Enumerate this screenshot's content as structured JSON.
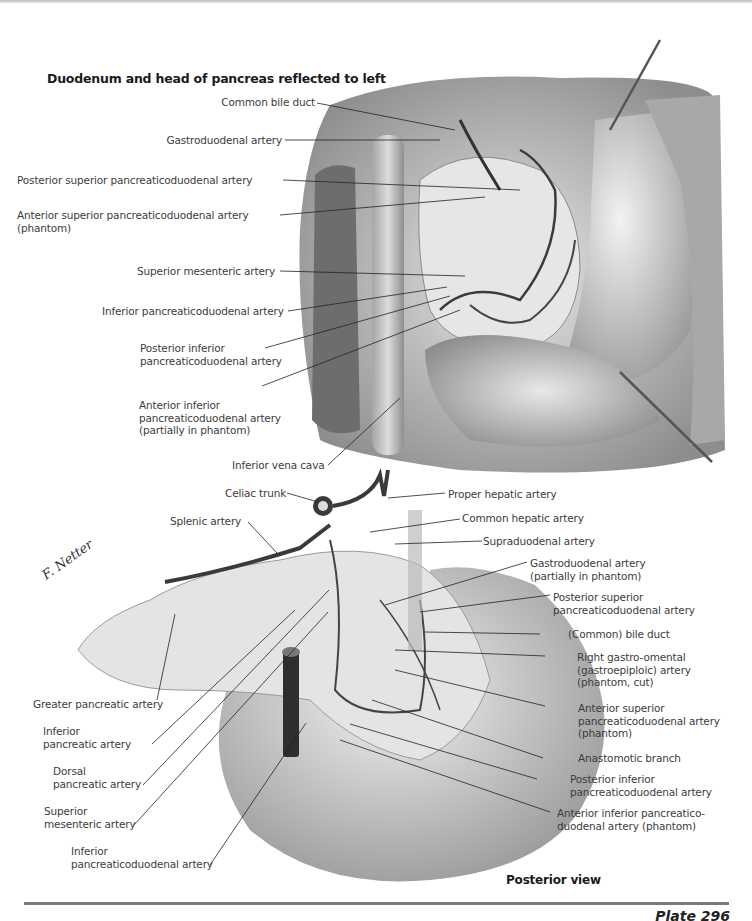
{
  "top_panel": {
    "title": "Duodenum and head of pancreas reflected to left",
    "labels": [
      {
        "text": "Common bile duct"
      },
      {
        "text": "Gastroduodenal artery"
      },
      {
        "text": "Posterior superior pancreaticoduodenal artery"
      },
      {
        "line1": "Anterior superior pancreaticoduodenal artery",
        "line2": "(phantom)"
      },
      {
        "text": "Superior mesenteric artery"
      },
      {
        "text": "Inferior pancreaticoduodenal artery"
      },
      {
        "line1": "Posterior inferior",
        "line2": "pancreaticoduodenal artery"
      },
      {
        "line1": "Anterior inferior",
        "line2": "pancreaticoduodenal artery",
        "line3": "(partially in phantom)"
      },
      {
        "text": "Inferior vena cava"
      }
    ]
  },
  "bottom_panel": {
    "view_label": "Posterior view",
    "signature": "F. Netter",
    "left_labels": [
      {
        "text": "Celiac trunk"
      },
      {
        "text": "Splenic artery"
      },
      {
        "text": "Greater pancreatic artery"
      },
      {
        "line1": "Inferior",
        "line2": "pancreatic artery"
      },
      {
        "line1": "Dorsal",
        "line2": "pancreatic artery"
      },
      {
        "line1": "Superior",
        "line2": "mesenteric artery"
      },
      {
        "line1": "Inferior",
        "line2": "pancreaticoduodenal artery"
      }
    ],
    "right_labels": [
      {
        "text": "Proper hepatic artery"
      },
      {
        "text": "Common hepatic artery"
      },
      {
        "text": "Supraduodenal artery"
      },
      {
        "line1": "Gastroduodenal artery",
        "line2": "(partially in phantom)"
      },
      {
        "line1": "Posterior superior",
        "line2": "pancreaticoduodenal artery"
      },
      {
        "text": "(Common) bile duct"
      },
      {
        "line1": "Right gastro-omental",
        "line2": "(gastroepiploic) artery",
        "line3": "(phantom, cut)"
      },
      {
        "line1": "Anterior superior",
        "line2": "pancreaticoduodenal artery",
        "line3": "(phantom)"
      },
      {
        "text": "Anastomotic branch"
      },
      {
        "line1": "Posterior inferior",
        "line2": "pancreaticoduodenal artery"
      },
      {
        "line1": "Anterior inferior pancreatico-",
        "line2": "duodenal artery (phantom)"
      }
    ]
  },
  "footer": {
    "plate": "Plate 296"
  }
}
